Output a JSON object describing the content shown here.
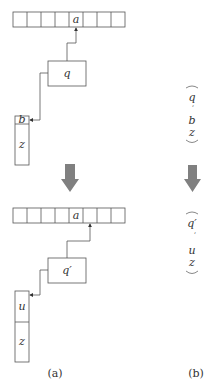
{
  "panel_a": {
    "label": "(a)",
    "before": {
      "array_cells": [
        "",
        "",
        "",
        "",
        "a",
        "",
        "",
        ""
      ],
      "head_state": "q",
      "stack": [
        "b",
        "z"
      ],
      "head_points_to_cell": 4
    },
    "after": {
      "array_cells": [
        "",
        "",
        "",
        "",
        "a",
        "",
        "",
        ""
      ],
      "head_state": "q′",
      "stack": [
        "u",
        "z"
      ],
      "head_points_to_cell": 5
    }
  },
  "panel_b": {
    "label": "(b)",
    "before": {
      "tuple": [
        "q",
        "b",
        "z"
      ],
      "state": "q",
      "stack_top": "b",
      "stack_rest": "z"
    },
    "after": {
      "tuple": [
        "q′",
        "u",
        "z"
      ],
      "state": "q′",
      "stack_top": "u",
      "stack_rest": "z"
    }
  },
  "transition_arrow": {
    "color": "#808080"
  }
}
